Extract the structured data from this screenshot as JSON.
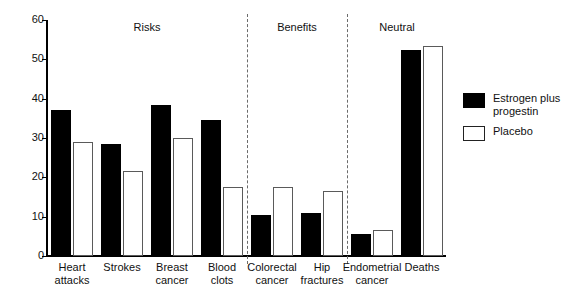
{
  "chart_data": {
    "type": "bar",
    "title": "",
    "xlabel": "",
    "ylabel": "",
    "ylim": [
      0,
      60
    ],
    "yticks": [
      0,
      10,
      20,
      30,
      40,
      50,
      60
    ],
    "grid": false,
    "legend_position": "right",
    "categories": [
      "Heart attacks",
      "Strokes",
      "Breast cancer",
      "Blood clots",
      "Colorectal cancer",
      "Hip fractures",
      "Endometrial cancer",
      "Deaths"
    ],
    "category_lines": [
      [
        "Heart",
        "attacks"
      ],
      [
        "Strokes",
        ""
      ],
      [
        "Breast",
        "cancer"
      ],
      [
        "Blood",
        "clots"
      ],
      [
        "Colorectal",
        "cancer"
      ],
      [
        "Hip",
        "fractures"
      ],
      [
        "Endometrial",
        "cancer"
      ],
      [
        "Deaths",
        ""
      ]
    ],
    "series": [
      {
        "name": "Estrogen plus progestin",
        "color": "#000000",
        "values": [
          37,
          28.5,
          38.5,
          34.5,
          10.5,
          11,
          5.5,
          52.5
        ]
      },
      {
        "name": "Placebo",
        "color": "#ffffff",
        "values": [
          29,
          21.5,
          30,
          17.5,
          17.5,
          16.5,
          6.5,
          53.5
        ]
      }
    ],
    "groups": [
      {
        "label": "Risks",
        "categories": [
          "Heart attacks",
          "Strokes",
          "Breast cancer",
          "Blood clots"
        ]
      },
      {
        "label": "Benefits",
        "categories": [
          "Colorectal cancer",
          "Hip fractures"
        ]
      },
      {
        "label": "Neutral",
        "categories": [
          "Endometrial cancer",
          "Deaths"
        ]
      }
    ],
    "annotations": []
  },
  "legend": {
    "items": [
      {
        "label": "Estrogen plus progestin",
        "swatch": "filled-black"
      },
      {
        "label": "Placebo",
        "swatch": "outlined-white"
      }
    ]
  }
}
